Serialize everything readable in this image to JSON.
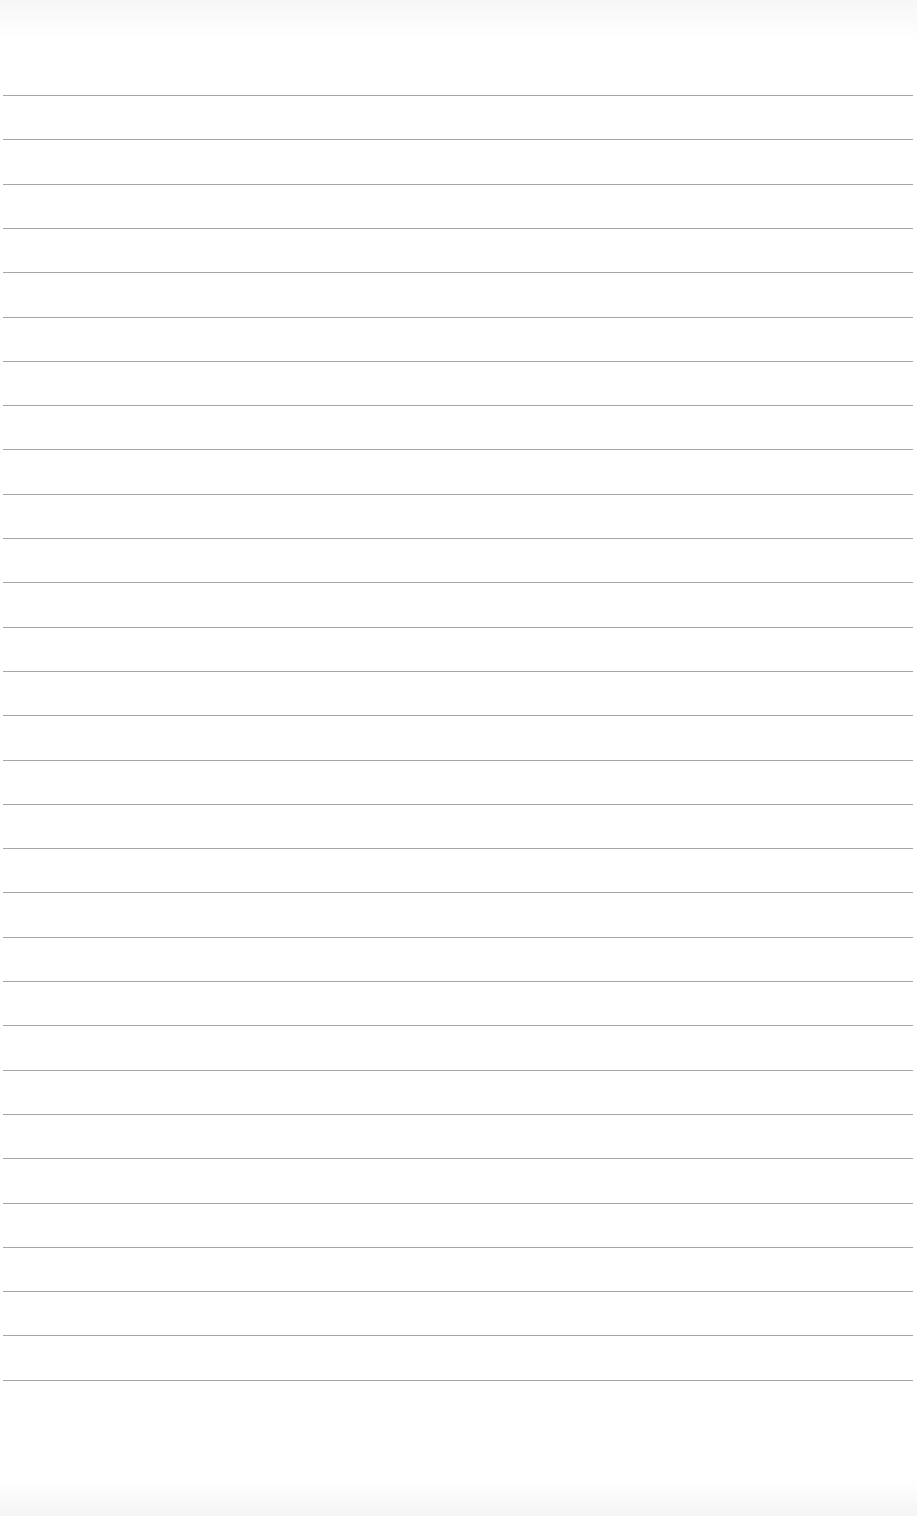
{
  "document": {
    "type": "lined-paper",
    "line_count": 30,
    "first_line_y": 95,
    "line_spacing": 44.3,
    "line_color": "#8f8f8f",
    "background_color": "#ffffff"
  }
}
